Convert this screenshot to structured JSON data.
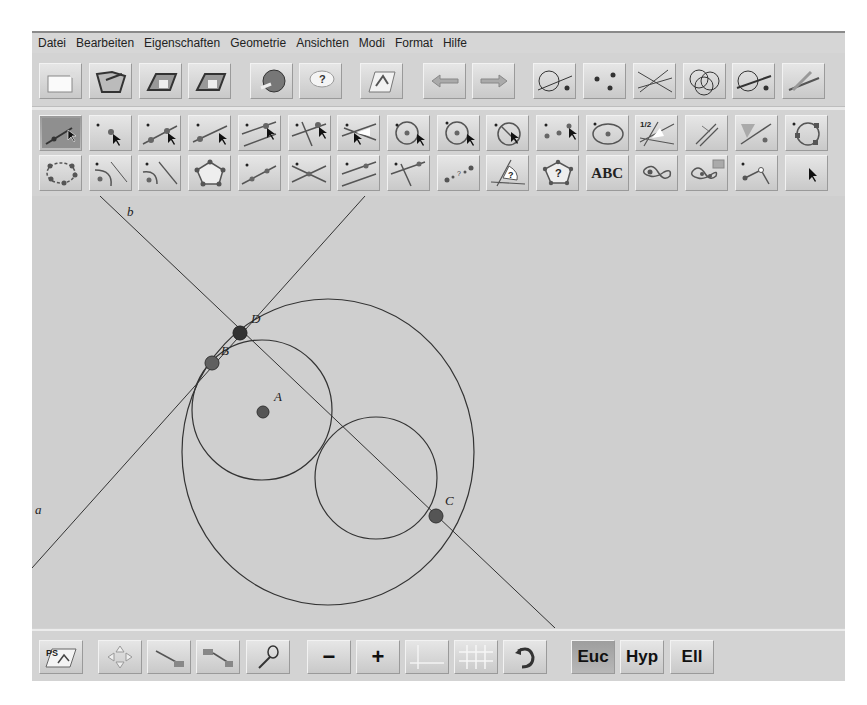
{
  "menu": [
    "Datei",
    "Bearbeiten",
    "Eigenschaften",
    "Geometrie",
    "Ansichten",
    "Modi",
    "Format",
    "Hilfe"
  ],
  "toolbar1": [
    {
      "name": "new-icon",
      "x": 7
    },
    {
      "name": "open-icon",
      "x": 57
    },
    {
      "name": "save-icon",
      "x": 107
    },
    {
      "name": "save-as-icon",
      "x": 156
    },
    {
      "name": "web-export-icon",
      "x": 218
    },
    {
      "name": "help-icon",
      "x": 267
    },
    {
      "name": "construction-window-icon",
      "x": 328
    },
    {
      "name": "undo-arrow-icon",
      "x": 391
    },
    {
      "name": "redo-arrow-icon",
      "x": 440
    },
    {
      "name": "intersect-line-circle-icon",
      "x": 501
    },
    {
      "name": "points-icon",
      "x": 551
    },
    {
      "name": "lines-icon",
      "x": 601
    },
    {
      "name": "circles-icon",
      "x": 651
    },
    {
      "name": "line-circle-point-icon",
      "x": 700
    },
    {
      "name": "trace-icon",
      "x": 750
    }
  ],
  "toolbar2": [
    "select-move-icon",
    "point-icon",
    "point-on-line-icon",
    "line-through-points-icon",
    "parallel-line-icon",
    "perpendicular-line-icon",
    "angle-bisector-icon",
    "circle-center-point-icon",
    "circle-center-icon",
    "circle-diameter-icon",
    "three-point-circle-icon",
    "ellipse-icon",
    "measure-angle-icon",
    "compass-icon",
    "reflect-icon",
    "circle-through-three-points-icon"
  ],
  "toolbar3": [
    "polygon-circle-icon",
    "circle-line-icon",
    "half-circle-line-icon",
    "pentagon-icon",
    "segment-points-icon",
    "intersection-icon",
    "parallel-segments-icon",
    "perpendicular-point-icon",
    "locus-points-icon",
    "angle-question-icon",
    "polygon-question-icon",
    "text-abc-icon",
    "curve-icon",
    "curve-macro-icon",
    "segment-join-icon",
    "pointer-icon"
  ],
  "text_tool_label": "ABC",
  "bottom_toolbar": {
    "buttons": [
      {
        "name": "ps-export-button",
        "x": 7
      },
      {
        "name": "move-view-button",
        "x": 66
      },
      {
        "name": "zoom-segment-button",
        "x": 115
      },
      {
        "name": "zoom-window-button",
        "x": 164
      },
      {
        "name": "magnifier-button",
        "x": 214
      },
      {
        "name": "zoom-out-button",
        "x": 275,
        "label": "−"
      },
      {
        "name": "zoom-in-button",
        "x": 324,
        "label": "+"
      },
      {
        "name": "axes-button",
        "x": 373
      },
      {
        "name": "grid-button",
        "x": 422
      },
      {
        "name": "rotate-button",
        "x": 471
      }
    ],
    "geometry_modes": [
      {
        "label": "Euc",
        "selected": true
      },
      {
        "label": "Hyp",
        "selected": false
      },
      {
        "label": "Ell",
        "selected": false
      }
    ]
  },
  "canvas": {
    "background": "#cfcfcf",
    "labels": {
      "a": "a",
      "b": "b",
      "A": "A",
      "B": "B",
      "C": "C",
      "D": "D"
    },
    "points": [
      {
        "id": "A",
        "x": 231,
        "y": 216
      },
      {
        "id": "B",
        "x": 180,
        "y": 167
      },
      {
        "id": "C",
        "x": 404,
        "y": 320
      },
      {
        "id": "D",
        "x": 208,
        "y": 137
      }
    ],
    "circles": [
      {
        "id": "small",
        "cx": 230,
        "cy": 214,
        "r": 70
      },
      {
        "id": "middle",
        "cx": 344,
        "cy": 282,
        "r": 61
      },
      {
        "id": "big",
        "cx": 296,
        "cy": 256,
        "rx": 146,
        "ry": 153
      }
    ],
    "lines": [
      {
        "id": "b",
        "x1": 68,
        "y1": 0,
        "x2": 523,
        "y2": 432
      },
      {
        "id": "a",
        "x1": 333,
        "y1": 0,
        "x2": 0,
        "y2": 372
      }
    ]
  }
}
